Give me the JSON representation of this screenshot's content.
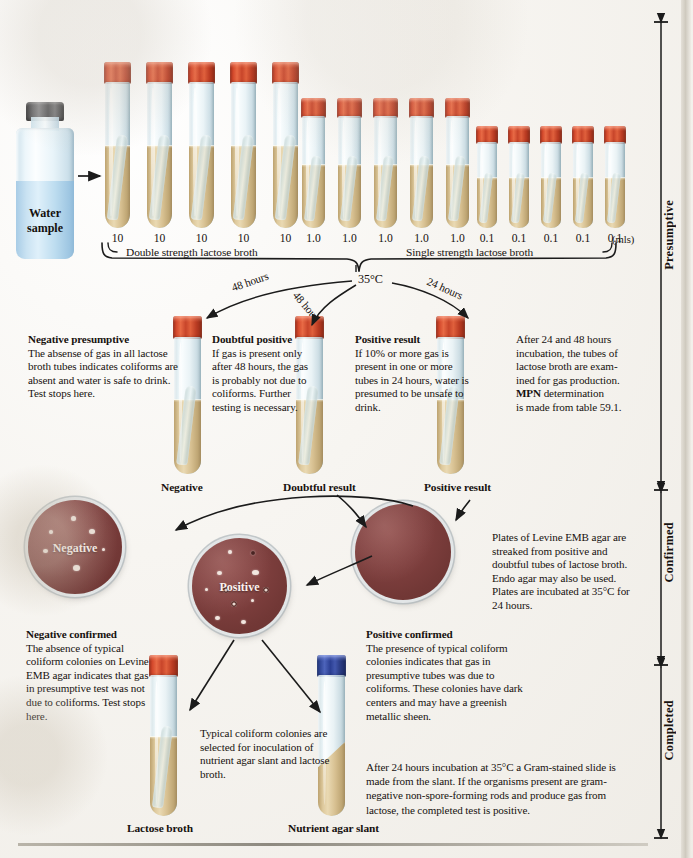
{
  "figure": {
    "incubation_temp": "35°C",
    "units_label": "(mls)"
  },
  "water_sample": {
    "label_line1": "Water",
    "label_line2": "sample"
  },
  "dilution_series": {
    "volumes": [
      "10",
      "10",
      "10",
      "10",
      "10",
      "1.0",
      "1.0",
      "1.0",
      "1.0",
      "1.0",
      "0.1",
      "0.1",
      "0.1",
      "0.1",
      "0.1"
    ],
    "bracket_left_label": "Double strength lactose broth",
    "bracket_right_label": "Single strength lactose broth"
  },
  "branches": [
    {
      "name": "left",
      "label": "48 hours"
    },
    {
      "name": "middle",
      "label": "48 hours"
    },
    {
      "name": "right",
      "label": "24 hours"
    }
  ],
  "presumptive": {
    "negative": {
      "heading": "Negative presumptive",
      "body": "The absense of gas in all lactose broth tubes indicates coliforms are absent and water is safe to drink. Test stops here.",
      "tube_caption": "Negative"
    },
    "doubtful": {
      "heading": "Doubtful positive",
      "body": "If gas is present only after 48 hours, the gas is probably not due to coliforms. Further testing is necessary.",
      "tube_caption": "Doubtful result"
    },
    "positive": {
      "heading": "Positive result",
      "body": "If 10% or more gas is present in one or more tubes in 24 hours, water is presumed to be unsafe to drink.",
      "tube_caption": "Positive result"
    },
    "note": {
      "line1": "After 24 and 48 hours",
      "line2": "incubation, the tubes of",
      "line3": "lactose broth are exam-",
      "line4": "ined for gas production.",
      "line5_bold": "MPN",
      "line5_rest": " determination",
      "line6": "is made from table 59.1."
    }
  },
  "confirmed": {
    "plates": [
      {
        "name": "negative-plate",
        "label": "Negative"
      },
      {
        "name": "positive-plate",
        "label": "Positive"
      },
      {
        "name": "streaked-plate",
        "label": ""
      }
    ],
    "note": "Plates of Levine EMB agar are streaked from positive and doubtful tubes of lactose broth.  Endo agar may also be used.  Plates are incubated at 35°C for 24 hours.",
    "negative_confirmed": {
      "heading": "Negative confirmed",
      "body": "The absence of typical coliform colonies on Levine EMB agar indicates that gas in presumptive test was not due to coliforms. Test stops here."
    },
    "positive_confirmed": {
      "heading": "Positive confirmed",
      "body": "The presence of typical coliform colonies indicates that gas in presumptive tubes was due to coliforms. These colonies have dark centers and may have a greenish metallic sheen."
    }
  },
  "completed": {
    "inoculation_note": "Typical coliform colonies are selected for inoculation of nutrient agar slant and lactose broth.",
    "final_note": "After 24 hours incubation at 35°C a Gram-stained slide is made from the slant.  If the organisms present are gram-negative non-spore-forming rods and produce gas from lactose, the completed test is positive.",
    "tube_captions": [
      {
        "name": "lactose-broth",
        "label": "Lactose broth"
      },
      {
        "name": "nutrient-agar-slant",
        "label": "Nutrient agar slant"
      }
    ]
  },
  "phase_rail": [
    {
      "name": "presumptive",
      "label": "Presumptive"
    },
    {
      "name": "confirmed",
      "label": "Confirmed"
    },
    {
      "name": "completed",
      "label": "Completed"
    }
  ],
  "colors": {
    "cap_red": "#c8452a",
    "cap_blue": "#2b3f93",
    "cap_gray": "#5c5c5e",
    "broth": "#ddc798",
    "agar": "#804040",
    "water": "#bcdcef",
    "ink": "#17120f"
  }
}
